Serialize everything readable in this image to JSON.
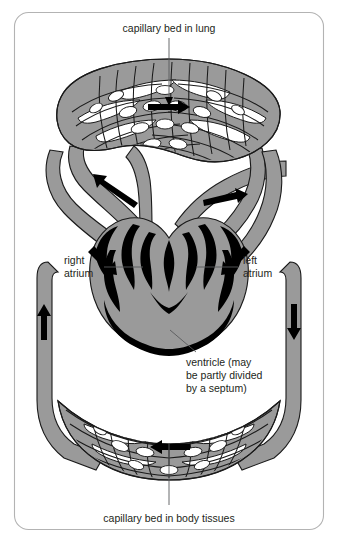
{
  "figure": {
    "frame": {
      "border_color": "#b3b3b3",
      "background_color": "#ffffff"
    },
    "palette": {
      "vessel_gray": "#9a9a9a",
      "outline_black": "#1a1a1a",
      "heart_chamber_black": "#000000",
      "text_color": "#231f20",
      "leader_line_color": "#58595b"
    },
    "labels": {
      "top": "capillary bed in lung",
      "bottom": "capillary bed in body tissues",
      "right_atrium_line1": "right",
      "right_atrium_line2": "atrium",
      "left_atrium_line1": "left",
      "left_atrium_line2": "atrium",
      "ventricle_line1": "ventricle (may",
      "ventricle_line2": "be partly divided",
      "ventricle_line3": "by a septum)"
    },
    "structures": [
      {
        "name": "capillary-bed-lung",
        "shape": "ellipse-mesh",
        "position": "top"
      },
      {
        "name": "capillary-bed-body-tissues",
        "shape": "lens-mesh",
        "position": "bottom"
      },
      {
        "name": "heart",
        "shape": "heart-with-black-chambers",
        "position": "center"
      },
      {
        "name": "right-atrium",
        "position": "center-left"
      },
      {
        "name": "left-atrium",
        "position": "center-right"
      },
      {
        "name": "ventricle",
        "position": "center-bottom"
      }
    ],
    "flow_arrows": [
      {
        "name": "flow-arrow-lung-bed",
        "direction": "right",
        "location": "top capillary bed"
      },
      {
        "name": "flow-arrow-upper-left-vessel",
        "direction": "up-left",
        "location": "upper left vessel"
      },
      {
        "name": "flow-arrow-upper-right-vessel",
        "direction": "right",
        "location": "upper right vessel"
      },
      {
        "name": "flow-arrow-left-side-vessel",
        "direction": "up",
        "location": "left side vessel"
      },
      {
        "name": "flow-arrow-right-side-vessel",
        "direction": "down",
        "location": "right side vessel"
      },
      {
        "name": "flow-arrow-into-right-atrium",
        "direction": "down-right",
        "location": "right atrium inflow"
      },
      {
        "name": "flow-arrow-into-left-atrium",
        "direction": "down-left",
        "location": "left atrium inflow"
      },
      {
        "name": "flow-arrow-body-bed",
        "direction": "left",
        "location": "bottom capillary bed"
      }
    ]
  }
}
